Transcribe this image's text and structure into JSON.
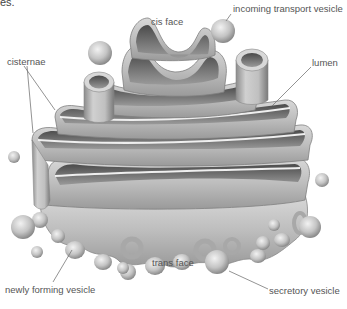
{
  "figure": {
    "clipped_caption_fragment": "es.",
    "labels": {
      "cis_face": "cis face",
      "incoming_vesicle": "incoming transport vesicle",
      "cisternae": "cisternae",
      "lumen": "lumen",
      "trans_face": "trans face",
      "newly_forming_vesicle": "newly forming vesicle",
      "secretory_vesicle": "secretory vesicle"
    },
    "colors": {
      "membrane_light": "#e6e6e6",
      "membrane_mid": "#b4b4b4",
      "membrane_dark": "#6e6e6e",
      "lumen_dark": "#555555",
      "leader_line": "#777777",
      "label_text": "#555555",
      "background": "#ffffff"
    }
  }
}
